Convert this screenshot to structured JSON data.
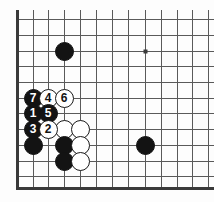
{
  "figure": {
    "kind": "go-board-diagram",
    "board": {
      "background_color": "#fdfdfd",
      "line_color": "#5a5a5a",
      "edge_color": "#3a3a3a",
      "grid_spacing_px": 15.8,
      "origin_x_px": 17,
      "origin_y_px": 19,
      "columns_px": [
        17,
        33,
        48,
        64,
        80,
        96,
        112,
        128,
        145,
        161,
        177,
        192,
        208
      ],
      "rows_px": [
        19,
        35,
        51,
        66,
        82,
        98,
        113,
        129,
        145,
        161,
        176,
        188
      ],
      "left_edge_px": 17,
      "bottom_edge_px": 188,
      "right_crop_px": 214,
      "top_crop_px": 10
    },
    "star_points": [
      {
        "name": "star-point-upper-right",
        "col": 8,
        "row": 2
      },
      {
        "name": "star-point-lower-left",
        "col": 3,
        "row": 8
      }
    ],
    "stones": [
      {
        "id": "black-corner-approach",
        "color": "black",
        "label": "",
        "col": 3,
        "row": 2
      },
      {
        "id": "black-right-side",
        "color": "black",
        "label": "",
        "col": 8,
        "row": 8
      },
      {
        "id": "move-7",
        "color": "black",
        "label": "7",
        "col": 1,
        "row": 5
      },
      {
        "id": "move-4",
        "color": "white",
        "label": "4",
        "col": 2,
        "row": 5
      },
      {
        "id": "move-6",
        "color": "white",
        "label": "6",
        "col": 3,
        "row": 5
      },
      {
        "id": "move-1",
        "color": "black",
        "label": "1",
        "col": 1,
        "row": 6
      },
      {
        "id": "move-5",
        "color": "black",
        "label": "5",
        "col": 2,
        "row": 6
      },
      {
        "id": "move-3",
        "color": "black",
        "label": "3",
        "col": 1,
        "row": 7
      },
      {
        "id": "move-2",
        "color": "white",
        "label": "2",
        "col": 2,
        "row": 7
      },
      {
        "id": "white-plain-a",
        "color": "white",
        "label": "",
        "col": 3,
        "row": 7
      },
      {
        "id": "white-plain-b",
        "color": "white",
        "label": "",
        "col": 4,
        "row": 7
      },
      {
        "id": "black-plain-a",
        "color": "black",
        "label": "",
        "col": 1,
        "row": 8
      },
      {
        "id": "black-plain-b",
        "color": "black",
        "label": "",
        "col": 3,
        "row": 8
      },
      {
        "id": "white-plain-c",
        "color": "white",
        "label": "",
        "col": 4,
        "row": 8
      },
      {
        "id": "black-plain-c",
        "color": "black",
        "label": "",
        "col": 3,
        "row": 9
      },
      {
        "id": "white-plain-d",
        "color": "white",
        "label": "",
        "col": 4,
        "row": 9
      }
    ],
    "move_sequence": [
      "1",
      "2",
      "3",
      "4",
      "5",
      "6",
      "7"
    ]
  }
}
